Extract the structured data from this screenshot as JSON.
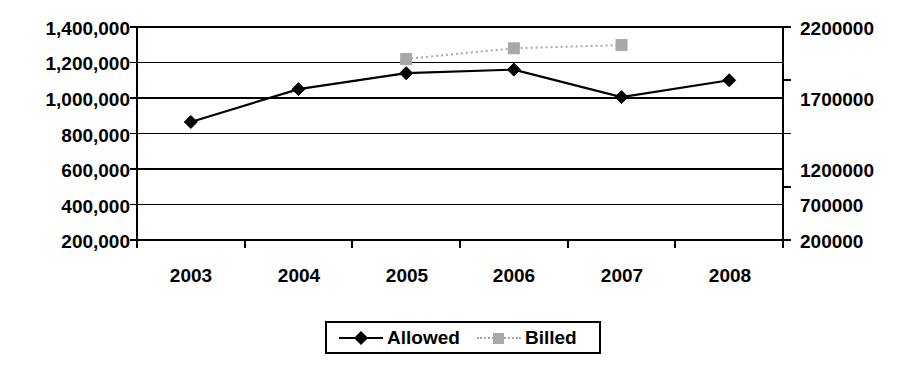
{
  "chart_data": {
    "type": "line",
    "title": "",
    "xlabel": "",
    "ylabel": "",
    "categories": [
      "2003",
      "2004",
      "2005",
      "2006",
      "2007",
      "2008"
    ],
    "series": [
      {
        "name": "Allowed",
        "axis": "left",
        "marker": "diamond",
        "color": "#000000",
        "line_style": "solid",
        "values": [
          865000,
          1050000,
          1140000,
          1160000,
          1005000,
          1100000
        ]
      },
      {
        "name": "Billed",
        "axis": "right",
        "marker": "square",
        "color": "#a8a8a8",
        "line_style": "dotted",
        "values": [
          null,
          null,
          1900000,
          2000000,
          2030000,
          null
        ]
      }
    ],
    "axes": {
      "left": {
        "ticks": [
          "1,400,000",
          "1,200,000",
          "1,000,000",
          "800,000",
          "600,000",
          "400,000",
          "200,000"
        ],
        "min": 200000,
        "max": 1400000
      },
      "right": {
        "ticks": [
          "2200000",
          "1700000",
          "1200000",
          "700000",
          "200000"
        ],
        "min": 200000,
        "max": 2200000
      },
      "x": {
        "ticks": [
          "2003",
          "2004",
          "2005",
          "2006",
          "2007",
          "2008"
        ]
      }
    },
    "grid": true,
    "legend": {
      "position": "bottom",
      "entries": [
        {
          "label": "Allowed",
          "marker": "diamond-marker",
          "color": "#000000"
        },
        {
          "label": "Billed",
          "marker": "square-marker",
          "color": "#a8a8a8"
        }
      ]
    }
  }
}
